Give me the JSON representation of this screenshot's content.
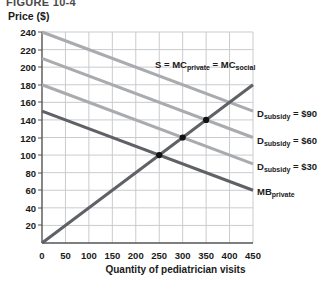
{
  "figure": {
    "caption": "FIGURE 10-4"
  },
  "chart_data": {
    "type": "line",
    "title": "",
    "xlabel": "Quantity of pediatrician visits",
    "ylabel": "Price ($)",
    "xlim": [
      0,
      450
    ],
    "ylim": [
      0,
      240
    ],
    "xticks": [
      0,
      50,
      100,
      150,
      200,
      250,
      300,
      350,
      400,
      450
    ],
    "yticks": [
      20,
      40,
      60,
      80,
      100,
      120,
      140,
      160,
      180,
      200,
      220,
      240
    ],
    "grid": true,
    "legend_position": "right-of-plot",
    "series": [
      {
        "name": "S = MC_private = MC_social",
        "label": "S = MC",
        "label_sub1": "private",
        "label_sub2": "social",
        "color": "#5f6166",
        "width": 3,
        "points": [
          [
            0,
            0
          ],
          [
            450,
            180
          ]
        ]
      },
      {
        "name": "MB_private",
        "label": "MB",
        "label_sub1": "private",
        "color": "#5f6166",
        "width": 3,
        "points": [
          [
            0,
            150
          ],
          [
            450,
            60
          ]
        ]
      },
      {
        "name": "D_subsidy = $30",
        "label": "D",
        "label_sub1": "subsidy",
        "label_value": "= $30",
        "color": "#a9abae",
        "width": 3,
        "points": [
          [
            0,
            180
          ],
          [
            450,
            90
          ]
        ]
      },
      {
        "name": "D_subsidy = $60",
        "label": "D",
        "label_sub1": "subsidy",
        "label_value": "= $60",
        "color": "#a9abae",
        "width": 3,
        "points": [
          [
            0,
            210
          ],
          [
            450,
            120
          ]
        ]
      },
      {
        "name": "D_subsidy = $90",
        "label": "D",
        "label_sub1": "subsidy",
        "label_value": "= $90",
        "color": "#a9abae",
        "width": 3,
        "points": [
          [
            0,
            240
          ],
          [
            450,
            150
          ]
        ]
      }
    ],
    "markers": [
      {
        "x": 250,
        "y": 100,
        "note": "MB_private × S"
      },
      {
        "x": 300,
        "y": 120,
        "note": "D_subsidy $30 × S"
      },
      {
        "x": 350,
        "y": 140,
        "note": "D_subsidy $60 × S"
      }
    ],
    "colors": {
      "grid": "#c9cbcd",
      "axis": "#555555",
      "dark_line": "#5f6166",
      "light_line": "#a9abae",
      "marker": "#111111"
    }
  },
  "labels": {
    "supply": {
      "head": "S = MC",
      "sub1": "private",
      "mid": "= MC",
      "sub2": "social"
    },
    "d90": {
      "head": "D",
      "sub": "subsidy",
      "value": "= $90"
    },
    "d60": {
      "head": "D",
      "sub": "subsidy",
      "value": "= $60"
    },
    "d30": {
      "head": "D",
      "sub": "subsidy",
      "value": "= $30"
    },
    "mb": {
      "head": "MB",
      "sub": "private"
    }
  }
}
